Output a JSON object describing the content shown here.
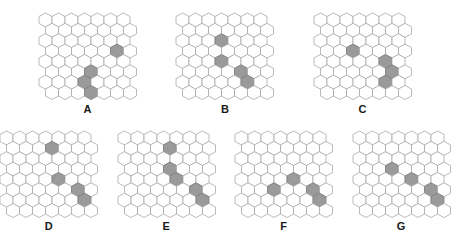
{
  "figure": {
    "title": "",
    "background_color": "#ffffff",
    "cell_shape": "hexagon",
    "cell_fill_empty": "#ffffff",
    "cell_fill_highlight": "#9a9a9a",
    "cell_stroke": "#a8a8a8",
    "label_color": "#1a1a1a",
    "grid": {
      "columns": 7,
      "rows": 8,
      "hex_width": 13,
      "hex_height": 14,
      "row_stagger": "odd-offset"
    }
  },
  "chart_data": {
    "type": "heatmap",
    "title": "",
    "xlabel": "",
    "ylabel": "",
    "grid_columns": 7,
    "grid_rows": 8,
    "legend": [],
    "panels": [
      {
        "label": "A",
        "row": 1,
        "highlighted_cells": [
          {
            "row": 3,
            "col": 5
          },
          {
            "row": 5,
            "col": 3
          },
          {
            "row": 6,
            "col": 3
          },
          {
            "row": 7,
            "col": 3
          }
        ],
        "highlight_count": 4
      },
      {
        "label": "B",
        "row": 1,
        "highlighted_cells": [
          {
            "row": 2,
            "col": 3
          },
          {
            "row": 4,
            "col": 3
          },
          {
            "row": 5,
            "col": 4
          },
          {
            "row": 6,
            "col": 5
          }
        ],
        "highlight_count": 4
      },
      {
        "label": "C",
        "row": 1,
        "highlighted_cells": [
          {
            "row": 3,
            "col": 2
          },
          {
            "row": 4,
            "col": 5
          },
          {
            "row": 5,
            "col": 5
          },
          {
            "row": 6,
            "col": 5
          }
        ],
        "highlight_count": 4
      },
      {
        "label": "D",
        "row": 2,
        "highlighted_cells": [
          {
            "row": 1,
            "col": 3
          },
          {
            "row": 4,
            "col": 4
          },
          {
            "row": 5,
            "col": 5
          },
          {
            "row": 6,
            "col": 6
          }
        ],
        "highlight_count": 4
      },
      {
        "label": "E",
        "row": 2,
        "highlighted_cells": [
          {
            "row": 1,
            "col": 3
          },
          {
            "row": 3,
            "col": 3
          },
          {
            "row": 4,
            "col": 4
          },
          {
            "row": 5,
            "col": 5
          },
          {
            "row": 6,
            "col": 6
          }
        ],
        "highlight_count": 5
      },
      {
        "label": "F",
        "row": 2,
        "highlighted_cells": [
          {
            "row": 4,
            "col": 4
          },
          {
            "row": 5,
            "col": 2
          },
          {
            "row": 5,
            "col": 5
          },
          {
            "row": 6,
            "col": 6
          }
        ],
        "highlight_count": 4
      },
      {
        "label": "G",
        "row": 2,
        "highlighted_cells": [
          {
            "row": 3,
            "col": 2
          },
          {
            "row": 4,
            "col": 4
          },
          {
            "row": 5,
            "col": 5
          },
          {
            "row": 6,
            "col": 6
          }
        ],
        "highlight_count": 4
      }
    ]
  },
  "layout": {
    "top_row_labels": [
      "A",
      "B",
      "C"
    ],
    "bottom_row_labels": [
      "D",
      "E",
      "F",
      "G"
    ],
    "top_row_y": 12,
    "bottom_row_y": 115,
    "panel_gap_top": 38,
    "panel_gap_bottom": 18
  }
}
